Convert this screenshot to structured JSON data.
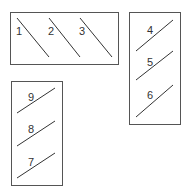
{
  "diagram": {
    "colors": {
      "box": "#555555",
      "line": "#333333",
      "background": "#ffffff"
    },
    "boxes": [
      {
        "id": "top-horizontal",
        "x": 10,
        "y": 12,
        "w": 108,
        "h": 52,
        "lines": [
          {
            "label": "1",
            "x1": 17,
            "y1": 18,
            "x2": 49,
            "y2": 57,
            "lx": 16,
            "ly": 35
          },
          {
            "label": "2",
            "x1": 49,
            "y1": 18,
            "x2": 80,
            "y2": 57,
            "lx": 48,
            "ly": 35
          },
          {
            "label": "3",
            "x1": 80,
            "y1": 18,
            "x2": 112,
            "y2": 57,
            "lx": 79,
            "ly": 35
          }
        ]
      },
      {
        "id": "right-vertical",
        "x": 129,
        "y": 12,
        "w": 51,
        "h": 112,
        "lines": [
          {
            "label": "4",
            "x1": 136,
            "y1": 51,
            "x2": 173,
            "y2": 20,
            "lx": 147,
            "ly": 34
          },
          {
            "label": "5",
            "x1": 136,
            "y1": 80,
            "x2": 173,
            "y2": 51,
            "lx": 147,
            "ly": 66
          },
          {
            "label": "6",
            "x1": 136,
            "y1": 117,
            "x2": 173,
            "y2": 85,
            "lx": 147,
            "ly": 99
          }
        ]
      },
      {
        "id": "bottom-left-vertical",
        "x": 11,
        "y": 81,
        "w": 51,
        "h": 104,
        "lines": [
          {
            "label": "9",
            "x1": 17,
            "y1": 113,
            "x2": 55,
            "y2": 88,
            "lx": 28,
            "ly": 101
          },
          {
            "label": "8",
            "x1": 17,
            "y1": 146,
            "x2": 55,
            "y2": 121,
            "lx": 28,
            "ly": 133
          },
          {
            "label": "7",
            "x1": 17,
            "y1": 178,
            "x2": 55,
            "y2": 153,
            "lx": 28,
            "ly": 166
          }
        ]
      }
    ]
  }
}
